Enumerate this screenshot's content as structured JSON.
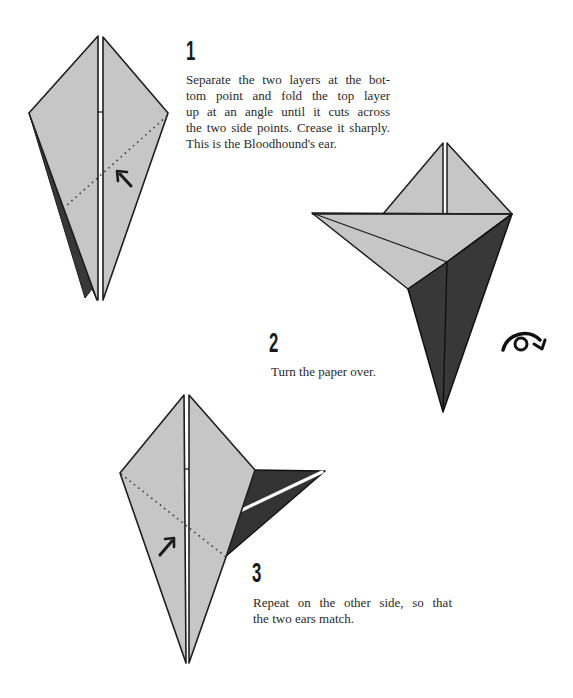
{
  "colors": {
    "paper_light": "#c6c6c6",
    "paper_dark": "#383838",
    "outline": "#1e1e1e",
    "text": "#2a2a2a"
  },
  "steps": [
    {
      "number": "1",
      "lines": [
        "Separate the two layers at the bot-",
        "tom point and fold the top layer",
        "up at an angle until it cuts across",
        "the two side points. Crease it sharply.",
        "This is the Bloodhound's ear."
      ],
      "icons": [
        "fold-arrow-icon"
      ]
    },
    {
      "number": "2",
      "lines": [
        "Turn the paper over."
      ],
      "icons": [
        "turn-over-icon"
      ]
    },
    {
      "number": "3",
      "lines": [
        "Repeat on the other side, so that",
        "the two ears match."
      ],
      "icons": [
        "fold-arrow-icon"
      ]
    }
  ]
}
